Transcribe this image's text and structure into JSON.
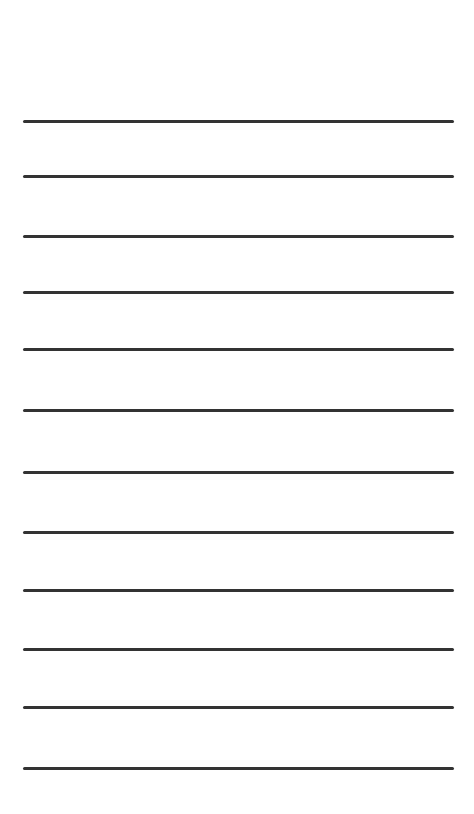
{
  "sheet": {
    "background": "#ffffff",
    "line_color": "#333333",
    "line_count": 12,
    "lines": [
      {
        "y": 120
      },
      {
        "y": 175
      },
      {
        "y": 235
      },
      {
        "y": 291
      },
      {
        "y": 348
      },
      {
        "y": 409
      },
      {
        "y": 471
      },
      {
        "y": 531
      },
      {
        "y": 589
      },
      {
        "y": 648
      },
      {
        "y": 706
      },
      {
        "y": 767
      }
    ]
  }
}
